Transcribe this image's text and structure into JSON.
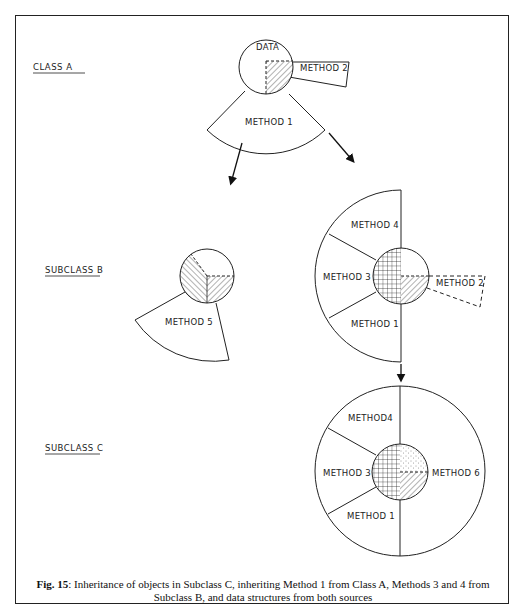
{
  "header": {
    "partial_text": "Object-Oriented Programming Languages"
  },
  "sections": {
    "class_a": "CLASS A",
    "subclass_b": "SUBCLASS B",
    "subclass_c": "SUBCLASS C"
  },
  "class_a": {
    "data_label": "DATA",
    "method1": "METHOD 1",
    "method2": "METHOD 2"
  },
  "subclass_b_left": {
    "method5": "METHOD 5"
  },
  "subclass_b_right": {
    "method4": "METHOD 4",
    "method3": "METHOD 3",
    "method1": "METHOD 1",
    "method2": "METHOD 2"
  },
  "subclass_c": {
    "method4": "METHOD4",
    "method3": "METHOD 3",
    "method1": "METHOD 1",
    "method6": "METHOD 6"
  },
  "caption": {
    "label": "Fig. 15",
    "text": ": Inheritance of objects in Subclass C, inheriting Method 1 from Class A, Methods 3 and 4 from Subclass B, and data structures from both sources"
  }
}
